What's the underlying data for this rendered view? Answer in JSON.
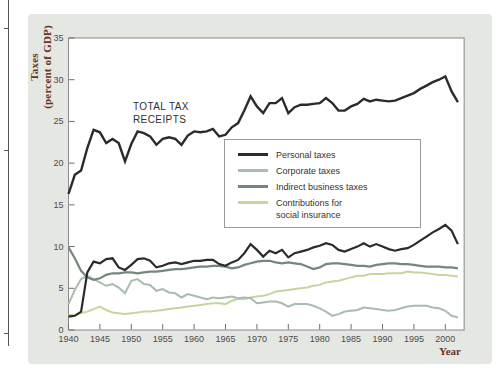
{
  "figure": {
    "y_axis_label_line1": "Taxes",
    "y_axis_label_line2": "(percent of GDP)",
    "x_axis_label": "Year",
    "annotation_line1": "TOTAL TAX",
    "annotation_line2": "RECEIPTS"
  },
  "colors": {
    "panel": "#e4e7e2",
    "plot_bg": "#ffffff",
    "frame": "#8a8a8a",
    "tick": "#6e6e6e",
    "tick_text": "#4c4c4c",
    "axis_title": "#6b3320",
    "dark_line": "#2b2b2b",
    "indirect_line": "#74877c",
    "corporate_line": "#a9bcae",
    "social_line": "#c6d59e"
  },
  "legend": {
    "items": [
      {
        "label": "Personal taxes",
        "label2": "",
        "series": 1
      },
      {
        "label": "Corporate taxes",
        "label2": "",
        "series": 2
      },
      {
        "label": "Indirect business taxes",
        "label2": "",
        "series": 3
      },
      {
        "label": "Contributions for",
        "label2": "social insurance",
        "series": 4
      }
    ]
  },
  "chart_data": {
    "type": "line",
    "title": "",
    "xlabel": "Year",
    "ylabel": "Taxes (percent of GDP)",
    "xlim": [
      1940,
      2003
    ],
    "ylim": [
      0,
      35
    ],
    "x_ticks": [
      1940,
      1945,
      1950,
      1955,
      1960,
      1965,
      1970,
      1975,
      1980,
      1985,
      1990,
      1995,
      2000
    ],
    "y_ticks": [
      0,
      5,
      10,
      15,
      20,
      25,
      30,
      35
    ],
    "grid": false,
    "legend_position": "inside upper-right box",
    "annotation": "TOTAL TAX RECEIPTS",
    "x": [
      1940,
      1941,
      1942,
      1943,
      1944,
      1945,
      1946,
      1947,
      1948,
      1949,
      1950,
      1951,
      1952,
      1953,
      1954,
      1955,
      1956,
      1957,
      1958,
      1959,
      1960,
      1961,
      1962,
      1963,
      1964,
      1965,
      1966,
      1967,
      1968,
      1969,
      1970,
      1971,
      1972,
      1973,
      1974,
      1975,
      1976,
      1977,
      1978,
      1979,
      1980,
      1981,
      1982,
      1983,
      1984,
      1985,
      1986,
      1987,
      1988,
      1989,
      1990,
      1991,
      1992,
      1993,
      1994,
      1995,
      1996,
      1997,
      1998,
      1999,
      2000,
      2001,
      2002
    ],
    "draw_order": [
      4,
      2,
      3,
      0,
      1
    ],
    "series": [
      {
        "name": "Total tax receipts",
        "color": "#2b2b2b",
        "width": 2.4,
        "values": [
          16.3,
          18.6,
          19.1,
          21.8,
          24.0,
          23.7,
          22.4,
          22.9,
          22.4,
          20.2,
          22.3,
          23.8,
          23.6,
          23.2,
          22.2,
          22.9,
          23.1,
          22.9,
          22.2,
          23.3,
          23.8,
          23.7,
          23.8,
          24.1,
          23.2,
          23.4,
          24.3,
          24.8,
          26.3,
          28.0,
          26.8,
          26.0,
          27.2,
          27.2,
          27.8,
          26.0,
          26.7,
          27.0,
          27.0,
          27.1,
          27.2,
          27.8,
          27.2,
          26.3,
          26.3,
          26.8,
          27.1,
          27.7,
          27.4,
          27.6,
          27.5,
          27.4,
          27.5,
          27.8,
          28.1,
          28.4,
          28.9,
          29.3,
          29.7,
          30.0,
          30.4,
          28.6,
          27.3
        ]
      },
      {
        "name": "Personal taxes",
        "color": "#2b2b2b",
        "width": 2.2,
        "values": [
          1.6,
          1.7,
          2.2,
          6.9,
          8.2,
          8.0,
          8.5,
          8.6,
          7.5,
          7.2,
          7.8,
          8.5,
          8.6,
          8.3,
          7.5,
          7.7,
          8.0,
          8.1,
          7.9,
          8.1,
          8.3,
          8.3,
          8.4,
          8.4,
          7.9,
          7.7,
          8.1,
          8.4,
          9.2,
          10.3,
          9.6,
          8.8,
          9.5,
          9.2,
          9.6,
          8.7,
          9.2,
          9.4,
          9.6,
          9.9,
          10.1,
          10.4,
          10.2,
          9.6,
          9.4,
          9.7,
          10.0,
          10.4,
          10.0,
          10.3,
          10.0,
          9.7,
          9.5,
          9.7,
          9.8,
          10.2,
          10.7,
          11.2,
          11.7,
          12.1,
          12.6,
          11.9,
          10.3
        ]
      },
      {
        "name": "Corporate taxes",
        "color": "#a9bcae",
        "width": 2.0,
        "values": [
          3.1,
          4.8,
          6.1,
          6.5,
          6.1,
          5.7,
          5.3,
          5.5,
          5.1,
          4.4,
          5.9,
          6.1,
          5.5,
          5.4,
          4.7,
          4.9,
          4.5,
          4.4,
          3.9,
          4.3,
          4.1,
          3.9,
          3.7,
          3.9,
          3.8,
          3.9,
          4.0,
          3.8,
          3.9,
          3.8,
          3.2,
          3.3,
          3.4,
          3.4,
          3.2,
          2.8,
          3.1,
          3.1,
          3.1,
          2.9,
          2.6,
          2.2,
          1.7,
          1.9,
          2.2,
          2.3,
          2.4,
          2.7,
          2.6,
          2.5,
          2.4,
          2.3,
          2.4,
          2.6,
          2.8,
          2.9,
          2.9,
          2.9,
          2.7,
          2.6,
          2.3,
          1.7,
          1.5
        ]
      },
      {
        "name": "Indirect business taxes",
        "color": "#74877c",
        "width": 2.2,
        "values": [
          9.9,
          8.6,
          7.1,
          6.3,
          6.0,
          6.2,
          6.6,
          6.8,
          6.8,
          6.9,
          6.9,
          6.8,
          6.9,
          7.0,
          7.0,
          7.1,
          7.2,
          7.3,
          7.3,
          7.4,
          7.5,
          7.6,
          7.6,
          7.7,
          7.7,
          7.6,
          7.4,
          7.5,
          7.8,
          8.0,
          8.2,
          8.3,
          8.3,
          8.1,
          8.0,
          8.1,
          8.0,
          7.9,
          7.6,
          7.3,
          7.5,
          7.9,
          8.0,
          8.0,
          7.9,
          7.8,
          7.7,
          7.7,
          7.6,
          7.8,
          7.9,
          8.0,
          8.0,
          7.9,
          7.9,
          7.8,
          7.7,
          7.6,
          7.6,
          7.6,
          7.5,
          7.5,
          7.4
        ]
      },
      {
        "name": "Contributions for social insurance",
        "color": "#c6d59e",
        "width": 2.0,
        "values": [
          1.8,
          1.8,
          2.0,
          2.2,
          2.5,
          2.8,
          2.4,
          2.1,
          2.0,
          1.9,
          2.0,
          2.1,
          2.2,
          2.2,
          2.3,
          2.4,
          2.5,
          2.6,
          2.7,
          2.8,
          2.9,
          3.0,
          3.1,
          3.2,
          3.2,
          3.1,
          3.5,
          3.7,
          3.7,
          3.9,
          4.0,
          4.1,
          4.3,
          4.6,
          4.7,
          4.8,
          4.9,
          5.0,
          5.1,
          5.3,
          5.4,
          5.7,
          5.8,
          5.9,
          6.1,
          6.3,
          6.5,
          6.5,
          6.7,
          6.7,
          6.7,
          6.8,
          6.8,
          6.8,
          7.0,
          6.9,
          6.9,
          6.8,
          6.7,
          6.6,
          6.6,
          6.5,
          6.4
        ]
      }
    ]
  }
}
